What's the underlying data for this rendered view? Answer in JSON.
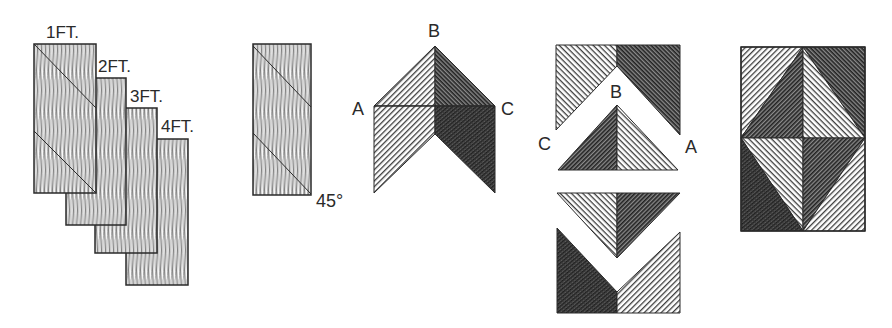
{
  "diagram": {
    "type": "quilt-block-construction",
    "colors": {
      "ink": "#2a2a2a",
      "light_fabric": "#bdbdbd",
      "dark_fabric": "#555555",
      "background": "#ffffff"
    },
    "steps": [
      {
        "id": "cut-strips",
        "description": "Four wood-grain strips stacked in offset",
        "strip_labels": [
          "1FT.",
          "2FT.",
          "3FT.",
          "4FT."
        ]
      },
      {
        "id": "cut-45-angle",
        "description": "Single strip with two parallel diagonal cut lines",
        "angle_label": "45°"
      },
      {
        "id": "chevron-assembly",
        "description": "Chevron of light and dark halves with points labeled",
        "point_labels": {
          "left": "A",
          "top": "B",
          "right": "C"
        }
      },
      {
        "id": "rearrangement",
        "description": "Chevron pieces and triangles rearranged into four sections",
        "point_labels": {
          "left": "C",
          "top": "B",
          "right": "A"
        }
      },
      {
        "id": "finished-block",
        "description": "Finished rectangular block with central diamond of four triangles"
      }
    ]
  }
}
